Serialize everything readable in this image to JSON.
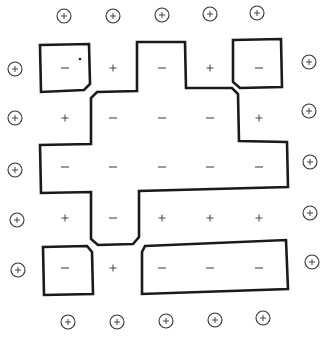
{
  "diagram": {
    "type": "spin-lattice-domain-contours",
    "colors": {
      "contour": "#1a1a1a",
      "sign": "#555555",
      "boundary_ring": "#333333",
      "background": "#ffffff"
    },
    "grid": {
      "columns_x": [
        65,
        113,
        162,
        210,
        259
      ],
      "rows_y": [
        68,
        118,
        167,
        218,
        268
      ],
      "signs": [
        [
          "-",
          "+",
          "-",
          "+",
          "-"
        ],
        [
          "+",
          "-",
          "-",
          "-",
          "+"
        ],
        [
          "-",
          "-",
          "-",
          "-",
          "-"
        ],
        [
          "+",
          "-",
          "+",
          "+",
          "+"
        ],
        [
          "-",
          "+",
          "-",
          "-",
          "-"
        ]
      ]
    },
    "boundary_spins": {
      "sign": "+",
      "top": [
        [
          64,
          16
        ],
        [
          113,
          16
        ],
        [
          162,
          15
        ],
        [
          210,
          14
        ],
        [
          257,
          13
        ]
      ],
      "bottom": [
        [
          68,
          322
        ],
        [
          117,
          322
        ],
        [
          166,
          321
        ],
        [
          215,
          320
        ],
        [
          263,
          318
        ]
      ],
      "left": [
        [
          15,
          69
        ],
        [
          15,
          118
        ],
        [
          15,
          170
        ],
        [
          17,
          220
        ],
        [
          18,
          270
        ]
      ],
      "right": [
        [
          309,
          62
        ],
        [
          309,
          111
        ],
        [
          310,
          162
        ],
        [
          310,
          213
        ],
        [
          312,
          262
        ]
      ]
    },
    "contours": [
      {
        "name": "top-left-box",
        "points": "40,45 89,44 90,84 84,90 41,92"
      },
      {
        "name": "central-cross",
        "points": "137,42 185,42 186,88 232,88 238,94 239,141 287,142 288,187 139,191 139,237 133,244 98,245 91,239 91,192 41,193 40,145 91,144 91,98 97,92 137,91"
      },
      {
        "name": "top-right-box",
        "points": "233,40 281,39 282,87 240,88 233,82"
      },
      {
        "name": "bottom-left-box",
        "points": "43,247 87,246 92,252 93,294 44,295"
      },
      {
        "name": "bottom-right-box",
        "points": "145,246 286,240 288,289 142,294 142,252"
      }
    ],
    "annotation_dot": [
      80,
      59
    ]
  }
}
